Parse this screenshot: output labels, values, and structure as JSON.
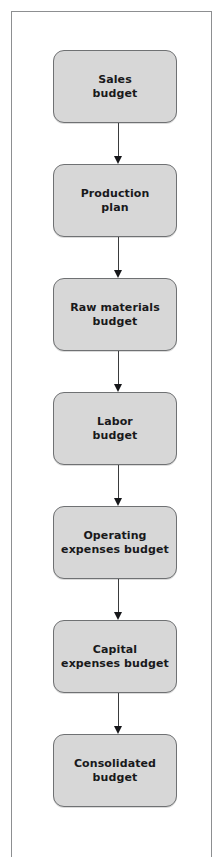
{
  "figure": {
    "type": "flowchart",
    "orientation": "vertical",
    "frame": {
      "visible": true,
      "border_color": "#8d8f91"
    },
    "style": {
      "node_fill": "#d7d7d7",
      "node_border": "#6f7173",
      "text_color": "#19191b",
      "arrow_color": "#16171a",
      "page_background": "#ffffff"
    },
    "nodes": [
      {
        "id": "sales-budget",
        "label": "Sales\nbudget"
      },
      {
        "id": "production-plan",
        "label": "Production\nplan"
      },
      {
        "id": "raw-materials-budget",
        "label": "Raw materials\nbudget"
      },
      {
        "id": "labor-budget",
        "label": "Labor\nbudget"
      },
      {
        "id": "operating-expenses-budget",
        "label": "Operating\nexpenses budget"
      },
      {
        "id": "capital-expenses-budget",
        "label": "Capital\nexpenses budget"
      },
      {
        "id": "consolidated-budget",
        "label": "Consolidated\nbudget"
      }
    ],
    "edges": [
      {
        "from": "sales-budget",
        "to": "production-plan",
        "arrow": "down"
      },
      {
        "from": "production-plan",
        "to": "raw-materials-budget",
        "arrow": "down"
      },
      {
        "from": "raw-materials-budget",
        "to": "labor-budget",
        "arrow": "down"
      },
      {
        "from": "labor-budget",
        "to": "operating-expenses-budget",
        "arrow": "down"
      },
      {
        "from": "operating-expenses-budget",
        "to": "capital-expenses-budget",
        "arrow": "down"
      },
      {
        "from": "capital-expenses-budget",
        "to": "consolidated-budget",
        "arrow": "down"
      }
    ]
  }
}
